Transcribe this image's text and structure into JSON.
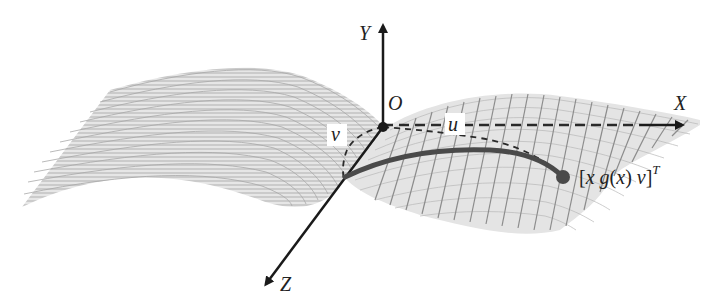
{
  "diagram": {
    "type": "3d-surface-coordinate-frame",
    "axes": {
      "x_label": "X",
      "y_label": "Y",
      "z_label": "Z"
    },
    "origin_label": "O",
    "param_labels": {
      "u": "u",
      "v": "v"
    },
    "point_label": {
      "open": "[",
      "x": "x",
      "g": "g",
      "paren_open": "(",
      "arg": "x",
      "paren_close": ")",
      "v": "v",
      "close": "]",
      "superscript": "T"
    },
    "colors": {
      "axis": "#1a1a1a",
      "curve": "#4a4a4a",
      "point": "#4a4a4a",
      "surface_fill": "#dcdcdc",
      "surface_lines": "#a8a8a8",
      "grid_lines": "#8c8c8c",
      "dashed": "#2a2a2a"
    }
  }
}
